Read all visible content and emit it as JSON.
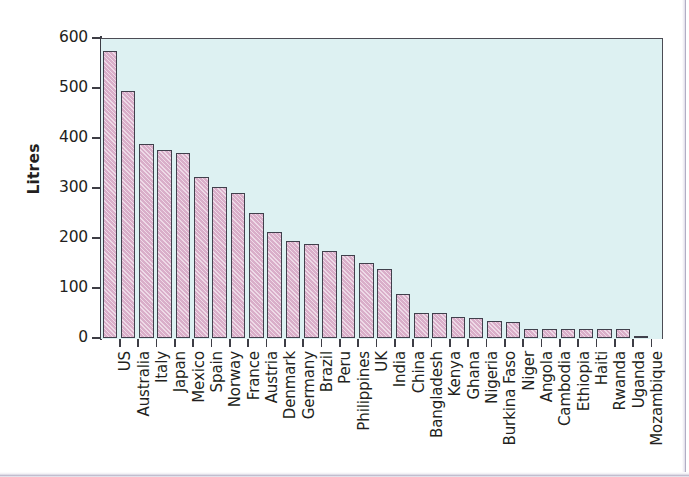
{
  "chart_data": {
    "type": "bar",
    "title": "",
    "xlabel": "",
    "ylabel": "Litres",
    "ylim": [
      0,
      600
    ],
    "ytick_values": [
      0,
      100,
      200,
      300,
      400,
      500,
      600
    ],
    "ytick_labels": [
      "0",
      "100",
      "200",
      "300",
      "400",
      "500",
      "600"
    ],
    "grid": false,
    "legend": false,
    "plot_background_color": "#ddf1f2",
    "bar_fill_color": "#d9aec9",
    "bar_edge_color": "#40404c",
    "categories": [
      "US",
      "Australia",
      "Italy",
      "Japan",
      "Mexico",
      "Spain",
      "Norway",
      "France",
      "Austria",
      "Denmark",
      "Germany",
      "Brazil",
      "Peru",
      "Philippines",
      "UK",
      "India",
      "China",
      "Bangladesh",
      "Kenya",
      "Ghana",
      "Nigeria",
      "Burkina Faso",
      "Niger",
      "Angola",
      "Cambodia",
      "Ethiopia",
      "Haiti",
      "Rwanda",
      "Uganda",
      "Mozambique"
    ],
    "values": [
      575,
      495,
      389,
      377,
      370,
      322,
      303,
      290,
      251,
      212,
      194,
      189,
      175,
      166,
      151,
      138,
      88,
      51,
      50,
      42,
      40,
      34,
      32,
      18,
      18,
      18,
      18,
      18,
      18,
      5
    ]
  }
}
